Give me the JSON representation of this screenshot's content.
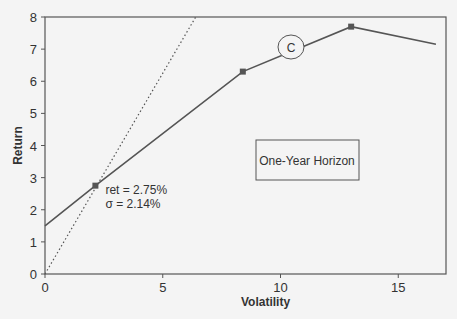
{
  "chart_data": {
    "type": "line",
    "title": "",
    "xlabel": "Volatility",
    "ylabel": "Return",
    "xlim": [
      0,
      17
    ],
    "ylim": [
      0,
      8
    ],
    "xticks": [
      0,
      5,
      10,
      15
    ],
    "yticks": [
      0,
      1,
      2,
      3,
      4,
      5,
      6,
      7,
      8
    ],
    "grid": false,
    "series": [
      {
        "name": "Efficient frontier",
        "style": "solid",
        "points": [
          [
            0,
            1.5
          ],
          [
            2.14,
            2.75
          ],
          [
            8.4,
            6.3
          ],
          [
            13.0,
            7.7
          ],
          [
            16.6,
            7.15
          ]
        ],
        "markers": [
          [
            2.14,
            2.75
          ],
          [
            8.4,
            6.3
          ],
          [
            13.0,
            7.7
          ]
        ]
      },
      {
        "name": "Tangent line",
        "style": "dotted",
        "points": [
          [
            0,
            0
          ],
          [
            6.4,
            8
          ]
        ]
      }
    ],
    "annotations": [
      {
        "id": "tangency",
        "text_lines": [
          "ret = 2.75%",
          "σ  = 2.14%"
        ],
        "x": 2.14,
        "y": 2.75
      },
      {
        "id": "point-c",
        "text": "C",
        "x": 10.6,
        "y": 7.0,
        "shape": "circle"
      },
      {
        "id": "horizon-box",
        "text": "One-Year Horizon",
        "x": 11.2,
        "y": 3.6,
        "shape": "box"
      }
    ]
  }
}
